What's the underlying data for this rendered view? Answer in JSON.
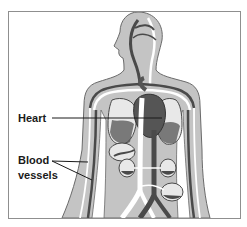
{
  "diagram": {
    "labels": {
      "heart": "Heart",
      "blood_vessels_line1": "Blood",
      "blood_vessels_line2": "vessels"
    },
    "colors": {
      "body": "#c4c4c4",
      "outline": "#6a6a6a",
      "artery": "#ffffff",
      "vein": "#4a4a4a",
      "heart": "#555555",
      "organ": "#e8e8e8",
      "frame": "#8f8f8f",
      "text": "#1a1a1a"
    }
  }
}
